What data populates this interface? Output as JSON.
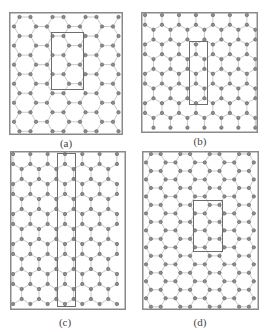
{
  "figure": {
    "colors": {
      "frame": "#8a8a8a",
      "bond": "#c4c4c4",
      "atom_fill": "#8e8e8e",
      "atom_stroke": "#5a5a5a",
      "cell_box": "#6e6e6e",
      "label": "#444444"
    },
    "panels": [
      {
        "id": "a",
        "label": "(a)",
        "frame": {
          "x": 9,
          "y": 12,
          "w": 114,
          "h": 123
        },
        "orientation": "flat",
        "bond": 11,
        "origin": {
          "x": 14,
          "y": 17
        },
        "cell": {
          "x": 51,
          "y": 32,
          "w": 32,
          "h": 57
        },
        "label_pos": {
          "x": 46,
          "y": 137
        }
      },
      {
        "id": "b",
        "label": "(b)",
        "frame": {
          "x": 141,
          "y": 12,
          "w": 117,
          "h": 121
        },
        "orientation": "pointy",
        "bond": 9.8,
        "origin": {
          "x": 145,
          "y": 15
        },
        "cell": {
          "x": 189,
          "y": 41,
          "w": 18,
          "h": 63
        },
        "label_pos": {
          "x": 180,
          "y": 135
        }
      },
      {
        "id": "c",
        "label": "(c)",
        "frame": {
          "x": 10,
          "y": 151,
          "w": 116,
          "h": 159
        },
        "orientation": "pointy",
        "bond": 10,
        "origin": {
          "x": 13,
          "y": 154
        },
        "cell": {
          "x": 57,
          "y": 153,
          "w": 18,
          "h": 153
        },
        "label_pos": {
          "x": 45,
          "y": 316
        }
      },
      {
        "id": "d",
        "label": "(d)",
        "frame": {
          "x": 142,
          "y": 151,
          "w": 117,
          "h": 159
        },
        "orientation": "flat",
        "bond": 9.8,
        "origin": {
          "x": 146,
          "y": 154
        },
        "cell": {
          "x": 193,
          "y": 200,
          "w": 29,
          "h": 51
        },
        "label_pos": {
          "x": 180,
          "y": 316
        }
      }
    ]
  }
}
